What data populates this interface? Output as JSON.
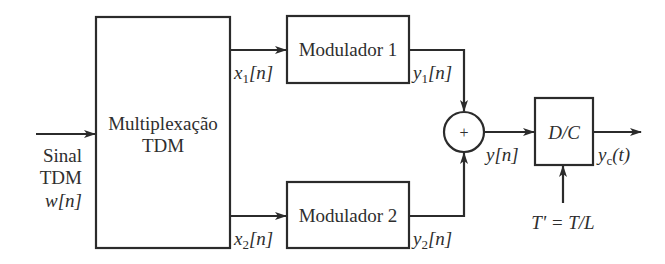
{
  "diagram": {
    "input": {
      "label_lines": [
        "Sinal",
        "TDM"
      ],
      "signal": "w[n]"
    },
    "blocks": {
      "multiplexer": {
        "line1": "Multiplexação",
        "line2": "TDM"
      },
      "modulator1": {
        "label": "Modulador 1"
      },
      "modulator2": {
        "label": "Modulador 2"
      },
      "adder": {
        "symbol": "+"
      },
      "dc_converter": {
        "label": "D/C"
      }
    },
    "signals": {
      "x1": {
        "base": "x",
        "sub": "1",
        "arg": "[n]"
      },
      "x2": {
        "base": "x",
        "sub": "2",
        "arg": "[n]"
      },
      "y1": {
        "base": "y",
        "sub": "1",
        "arg": "[n]"
      },
      "y2": {
        "base": "y",
        "sub": "2",
        "arg": "[n]"
      },
      "y": {
        "label": "y[n]"
      },
      "yc": {
        "base": "y",
        "sub": "c",
        "arg": "(t)"
      }
    },
    "sampling_period": {
      "label": "T' = T/L"
    }
  }
}
